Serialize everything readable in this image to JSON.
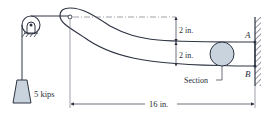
{
  "diagram": {
    "load_label": "5 kips",
    "dim_top": "2 in.",
    "dim_bottom": "2 in.",
    "dim_length": "16 in.",
    "point_a": "A",
    "point_b": "B",
    "section_label": "Section"
  },
  "colors": {
    "line": "#2e3442",
    "fill": "#c9d3de",
    "thin": "#5a6270"
  }
}
